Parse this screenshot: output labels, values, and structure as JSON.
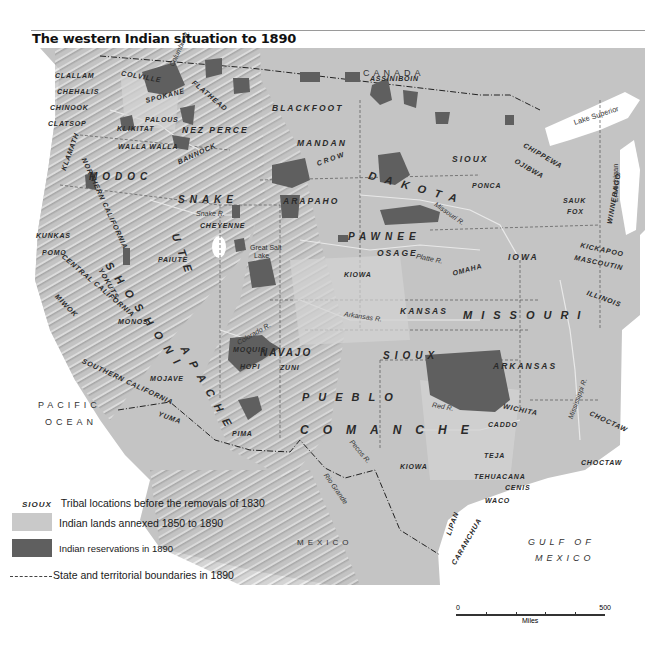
{
  "title": "The western Indian situation to 1890",
  "colors": {
    "annexed_lands": "#c9c9c9",
    "reservations": "#5f5f5f",
    "terrain": "#bdbdbd",
    "water": "#ffffff",
    "label": "#2a2a2a"
  },
  "geography": {
    "canada": "CANADA",
    "pacific": [
      "PACIFIC",
      "OCEAN"
    ],
    "gulf": [
      "GULF OF",
      "MEXICO"
    ],
    "mexico": "MEXICO",
    "lake_superior": "Lake Superior",
    "lake_michigan": "L. Michigan",
    "great_salt_lake": [
      "Great Salt",
      "Lake"
    ],
    "rivers": {
      "columbia": "Columbia R.",
      "snake": "Snake R.",
      "missouri": "Missouri R.",
      "platte": "Platte R.",
      "arkansas": "Arkansas R.",
      "colorado": "Colorado R.",
      "red": "Red R.",
      "pecos": "Pecos R.",
      "rio_grande": "Rio Grande",
      "mississippi": "Mississippi R."
    }
  },
  "tribes": {
    "small": {
      "clallam": "CLALLAM",
      "chehalis": "CHEHALIS",
      "chinook": "CHINOOK",
      "clatsop": "CLATSOP",
      "colville": "COLVILLE",
      "spokane": "SPOKANE",
      "flathead": "FLATHEAD",
      "palous": "PALOUS",
      "klikitat": "KLIKITAT",
      "walla_walla": "WALLA WALLA",
      "bannock": "BANNOCK",
      "klamath": "KLAMATH",
      "northern_california": "NORTHERN CALIFORNIA",
      "kunkas": "KUNKAS",
      "pomo": "POMO",
      "central_california": "CENTRAL CALIFORNIA",
      "miwok": "MIWOK",
      "yokuts": "YOKUTS",
      "mono": "MONOS",
      "paiute": "PAIUTE",
      "cheyenne": "CHEYENNE",
      "mojave": "MOJAVE",
      "southern_california": "SOUTHERN CALIFORNIA",
      "yuma": "YUMA",
      "pima": "PIMA",
      "moquis": "MOQUIS",
      "hopi": "HOPI",
      "zuni": "ZUNI",
      "assiniboin": "ASSINIBOIN",
      "ponca": "PONCA",
      "chippewa": "CHIPPEWA",
      "ojibwa": "OJIBWA",
      "winnebago": "WINNEBAGO",
      "sauk": "SAUK",
      "fox": "FOX",
      "kickapoo": "KICKAPOO",
      "mascoutin": "MASCOUTIN",
      "illinois": "ILLINOIS",
      "kiowa_n": "KIOWA",
      "omaha": "OMAHA",
      "wichita": "WICHITA",
      "caddo": "CADDO",
      "choctaw_1": "CHOCTAW",
      "choctaw_2": "CHOCTAW",
      "teja": "TEJA",
      "tehuacana": "TEHUACANA",
      "cenis": "CENIS",
      "waco": "WACO",
      "lipan": "LIPAN",
      "carancahua": "CARANCHUA",
      "kiowa_s": "KIOWA"
    },
    "medium": {
      "nez_perce": "NEZ PERCE",
      "blackfoot": "BLACKFOOT",
      "mandan": "MANDAN",
      "crow": "CROW",
      "arapaho": "ARAPAHO",
      "modoc": "MODOC",
      "snake": "SNAKE",
      "sioux_n": "SIOUX",
      "pawnee": "PAWNEE",
      "osage": "OSAGE",
      "iowa": "IOWA",
      "kansas": "KANSAS",
      "arkansas": "ARKANSAS",
      "navajo": "NAVAJO",
      "sioux_s": "SIOUX"
    },
    "big": {
      "dakota": "DAKOTA",
      "ute": "UTE",
      "shoshoni": "SHOSHONI",
      "apache": "APACHE",
      "pueblo": "PUEBLO",
      "comanche": "COMANCHE",
      "missouri": "MISSOURI"
    }
  },
  "legend": {
    "sample_tribe": "SIOUX",
    "tribal_locations": "Tribal locations before the removals of 1830",
    "annexed": "Indian lands annexed 1850 to 1890",
    "reservations": "Indian reservations in 1890",
    "boundaries": "State and territorial boundaries in 1890"
  },
  "scale": {
    "start": "0",
    "end": "500",
    "unit": "Miles"
  }
}
